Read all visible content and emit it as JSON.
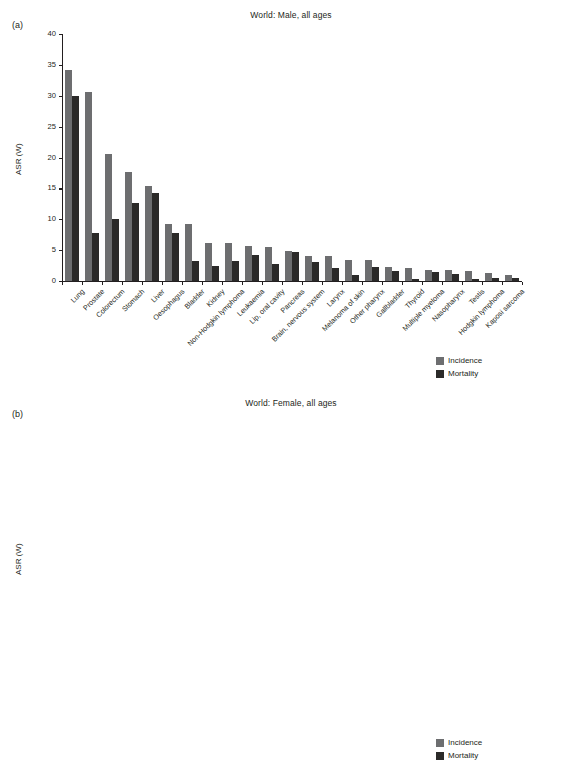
{
  "figure": {
    "legend": {
      "incidence_label": "Incidence",
      "mortality_label": "Mortality",
      "incidence_color": "#6d6e70",
      "mortality_color": "#2b2a29"
    }
  },
  "panel_a": {
    "tag": "(a)",
    "title": "World: Male, all ages"
  },
  "panel_b": {
    "tag": "(b)",
    "title": "World: Female, all ages"
  },
  "chart_data": [
    {
      "type": "bar",
      "panel": "(a)",
      "title": "World: Male, all ages",
      "xlabel": "",
      "ylabel": "ASR (W)",
      "ylim": [
        0,
        40
      ],
      "yticks": [
        0,
        5,
        10,
        15,
        20,
        25,
        30,
        35,
        40
      ],
      "grid": false,
      "legend_position": "bottom-right",
      "categories": [
        "Lung",
        "Prostate",
        "Colorectum",
        "Stomach",
        "Liver",
        "Oesophagus",
        "Bladder",
        "Kidney",
        "Non-Hodgkin lymphoma",
        "Leukaemia",
        "Lip, oral cavity",
        "Pancreas",
        "Brain, nervous system",
        "Larynx",
        "Melanoma of skin",
        "Other pharynx",
        "Gallbladder",
        "Thyroid",
        "Multiple myeloma",
        "Nasopharynx",
        "Testis",
        "Hodgkin lymphoma",
        "Kaposi sarcoma"
      ],
      "series": [
        {
          "name": "Incidence",
          "color": "#6d6e70",
          "values": [
            34.2,
            30.6,
            20.6,
            17.6,
            15.4,
            9.2,
            9.2,
            6.1,
            6.1,
            5.7,
            5.5,
            4.9,
            4.0,
            4.0,
            3.4,
            3.4,
            2.3,
            2.1,
            1.8,
            1.8,
            1.6,
            1.3,
            0.9
          ]
        },
        {
          "name": "Mortality",
          "color": "#2b2a29",
          "values": [
            30.0,
            7.8,
            10.0,
            12.7,
            14.3,
            7.8,
            3.3,
            2.5,
            3.3,
            4.2,
            2.8,
            4.7,
            3.0,
            2.1,
            1.0,
            2.3,
            1.7,
            0.4,
            1.4,
            1.1,
            0.4,
            0.5,
            0.5
          ]
        }
      ]
    },
    {
      "type": "bar",
      "panel": "(b)",
      "title": "World: Female, all ages",
      "xlabel": "",
      "ylabel": "ASR (W)",
      "ylim": [
        0,
        50
      ],
      "yticks": [
        0,
        5,
        10,
        15,
        20,
        25,
        30,
        35,
        40,
        45,
        50
      ],
      "grid": false,
      "legend_position": "bottom-right",
      "categories": [
        "Breast",
        "Colorectum",
        "Cervix uteri",
        "Lung",
        "Corpus uteri",
        "Stomach",
        "Ovary",
        "Thyroid",
        "Liver",
        "Non-Hodgkin lymphoma",
        "Leukaemia",
        "Pancreas",
        "Oesophagus",
        "Kidney",
        "Brain, nervous system",
        "Melanoma of skin",
        "Lip, oral cavity",
        "Gallbladder",
        "Bladder",
        "Multiple myeloma",
        "Nasopharynx",
        "Hodgkin lymphoma",
        "Other pharynx",
        "Larynx",
        "Kaposi sarcoma"
      ],
      "series": [
        {
          "name": "Incidence",
          "color": "#6d6e70",
          "values": [
            43.1,
            14.3,
            14.0,
            13.6,
            8.2,
            7.5,
            6.1,
            6.1,
            5.4,
            4.2,
            3.9,
            3.6,
            3.1,
            3.2,
            3.2,
            2.9,
            2.6,
            2.5,
            2.4,
            1.5,
            0.8,
            0.9,
            0.9,
            0.6,
            0.5
          ]
        },
        {
          "name": "Mortality",
          "color": "#2b2a29",
          "values": [
            12.9,
            6.9,
            6.8,
            11.1,
            1.8,
            5.7,
            3.8,
            0.6,
            5.1,
            2.0,
            2.9,
            3.5,
            2.7,
            1.3,
            2.2,
            0.6,
            1.3,
            1.9,
            1.0,
            1.0,
            0.4,
            0.3,
            0.6,
            0.2,
            0.4
          ]
        }
      ]
    }
  ]
}
